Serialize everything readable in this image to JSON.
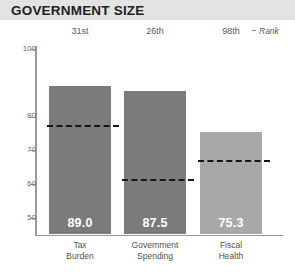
{
  "header": {
    "title": "GOVERNMENT SIZE",
    "band_color": "#e3e3e3"
  },
  "rank_legend": {
    "label": "Rank",
    "marker": "dash-marker"
  },
  "chart_data": {
    "type": "bar",
    "title": "GOVERNMENT SIZE",
    "xlabel": "",
    "ylabel": "",
    "ylim": [
      45,
      100
    ],
    "grid": false,
    "legend_position": "none",
    "categories": [
      "Tax Burden",
      "Government Spending",
      "Fiscal Health"
    ],
    "category_lines": [
      [
        "Tax",
        "Burden"
      ],
      [
        "Government",
        "Spending"
      ],
      [
        "Fiscal",
        "Health"
      ]
    ],
    "values": [
      89.0,
      87.5,
      75.3
    ],
    "value_labels": [
      "89.0",
      "87.5",
      "75.3"
    ],
    "ranks": [
      "31st",
      "26th",
      "98th"
    ],
    "reference_values": [
      77.5,
      61.5,
      67.0
    ],
    "reference_style": "dashed",
    "tick_values": [
      100,
      80,
      70,
      60,
      50
    ],
    "tick_labels": [
      "100",
      "80",
      "70",
      "60",
      "50"
    ],
    "bar_colors": [
      "#7b7b7b",
      "#7b7b7b",
      "#a8a8a8"
    ],
    "value_label_color": "#ffffff",
    "reference_line_color": "#161616",
    "axis_color": "#9a9a9a"
  }
}
